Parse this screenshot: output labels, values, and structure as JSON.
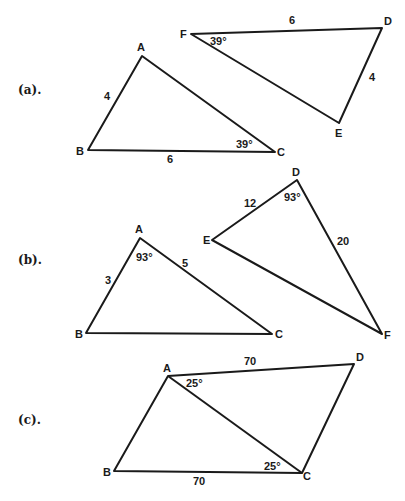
{
  "parts": [
    {
      "label": "(a).",
      "triangles": [
        {
          "vertices": {
            "A": [
              142,
              56
            ],
            "B": [
              88,
              150
            ],
            "C": [
              275,
              152
            ]
          },
          "vertex_labels": {
            "A": "A",
            "B": "B",
            "C": "C"
          },
          "measures": {
            "AB": "4",
            "BC": "6",
            "angle_C": "39°"
          }
        },
        {
          "vertices": {
            "F": [
              191,
              34
            ],
            "D": [
              382,
              28
            ],
            "E": [
              339,
              123
            ]
          },
          "vertex_labels": {
            "F": "F",
            "D": "D",
            "E": "E"
          },
          "measures": {
            "FD": "6",
            "DE": "4",
            "angle_F": "39°"
          }
        }
      ]
    },
    {
      "label": "(b).",
      "triangles": [
        {
          "vertices": {
            "A": [
              140,
              238
            ],
            "B": [
              86,
              333
            ],
            "C": [
              272,
              334
            ]
          },
          "vertex_labels": {
            "A": "A",
            "B": "B",
            "C": "C"
          },
          "measures": {
            "AB": "3",
            "AC": "5",
            "angle_A": "93°"
          }
        },
        {
          "vertices": {
            "D": [
              297,
              180
            ],
            "E": [
              212,
              240
            ],
            "F": [
              382,
              334
            ]
          },
          "vertex_labels": {
            "D": "D",
            "E": "E",
            "F": "F"
          },
          "measures": {
            "DE": "12",
            "DF": "20",
            "angle_D": "93°"
          }
        }
      ]
    },
    {
      "label": "(c).",
      "quadrilateral": {
        "vertices": {
          "A": [
            168,
            376
          ],
          "D": [
            354,
            364
          ],
          "B": [
            114,
            471
          ],
          "C": [
            302,
            473
          ]
        },
        "vertex_labels": {
          "A": "A",
          "B": "B",
          "C": "C",
          "D": "D"
        },
        "diagonal": "AC",
        "measures": {
          "AD": "70",
          "BC": "70",
          "angle_DAC": "25°",
          "angle_ACB": "25°"
        }
      }
    }
  ]
}
